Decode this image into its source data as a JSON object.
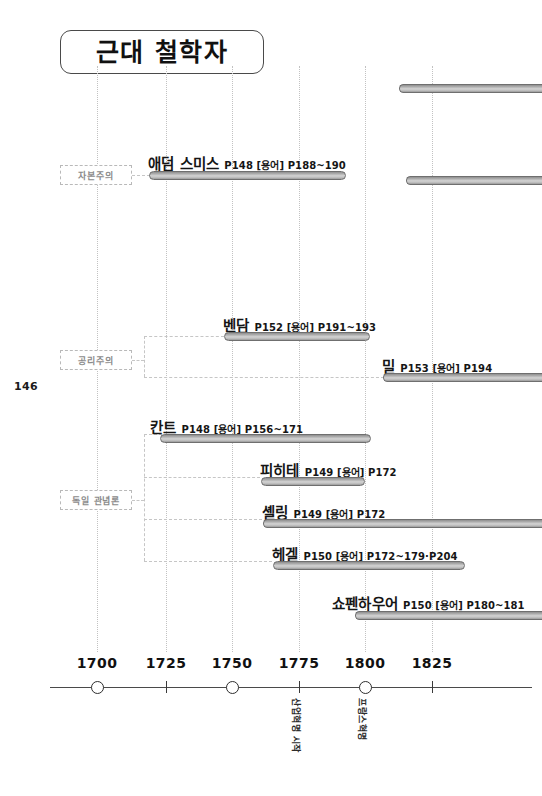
{
  "page": {
    "number": "146",
    "title": "근대 철학자"
  },
  "axis": {
    "years": [
      "1700",
      "1725",
      "1750",
      "1775",
      "1800",
      "1825"
    ],
    "markers": [
      "circle",
      "tick",
      "circle",
      "tick",
      "circle",
      "tick"
    ]
  },
  "events": [
    {
      "label": "산업혁명 시작",
      "year": "1775"
    },
    {
      "label": "프랑스혁명",
      "year": "1800"
    }
  ],
  "categories": [
    {
      "label": "자본주의"
    },
    {
      "label": "공리주의"
    },
    {
      "label": "독일 관념론"
    }
  ],
  "people": [
    {
      "name": "애덤 스미스",
      "ref": "P148  [용어] P188~190"
    },
    {
      "name": "벤담",
      "ref": "P152  [용어] P191~193"
    },
    {
      "name": "밀",
      "ref": "P153  [용어] P194"
    },
    {
      "name": "칸트",
      "ref": "P148  [용어] P156~171"
    },
    {
      "name": "피히테",
      "ref": "P149 [용어] P172"
    },
    {
      "name": "셸링",
      "ref": "P149  [용어] P172"
    },
    {
      "name": "헤겔",
      "ref": "P150  [용어] P172~179·P204"
    },
    {
      "name": "쇼펜하우어",
      "ref": "P150  [용어] P180~181"
    }
  ],
  "colors": {
    "bar_fill": "#c4c4c4",
    "bar_stroke": "#6f6f6f",
    "gridline": "#c2c2c2",
    "axis": "#4a4a4a",
    "category_text": "#8b8b8b",
    "text": "#111111"
  }
}
